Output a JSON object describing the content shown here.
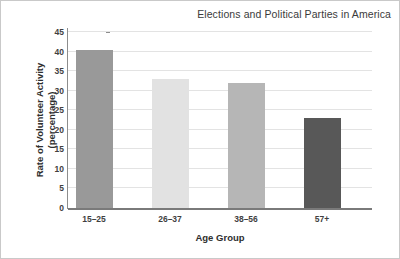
{
  "chart_data": {
    "type": "bar",
    "title": "Elections and Political Parties in America",
    "xlabel": "Age Group",
    "ylabel": "Rate of Volunteer Activity (percentage)",
    "ylabel_line1": "Rate of Volunteer Activity",
    "ylabel_line2": "(percentage)",
    "categories": [
      "15–25",
      "26–37",
      "38–56",
      "57+"
    ],
    "values": [
      40.5,
      33,
      32,
      23
    ],
    "bar_colors": [
      "#999999",
      "#e2e2e2",
      "#b6b6b6",
      "#585858"
    ],
    "ylim": [
      0,
      45
    ],
    "ytick_values": [
      0,
      5,
      10,
      15,
      20,
      25,
      30,
      35,
      40,
      45
    ],
    "ytick_labels": [
      "0",
      "5",
      "10",
      "15",
      "20",
      "25",
      "30",
      "35",
      "40",
      "45"
    ],
    "grid": true,
    "gridline_color": "#e3e3e3",
    "legend": null,
    "legend_position": "none",
    "axis_color": "#8d8d8d",
    "text_color": "#3f3f3f",
    "title_color": "#3b3b3b",
    "background": "#ffffff"
  }
}
